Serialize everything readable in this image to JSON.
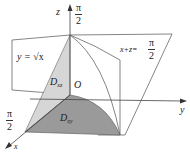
{
  "diagram": {
    "axes": {
      "x": "x",
      "y": "y",
      "z": "z"
    },
    "origin_label": "O",
    "z_intercept": {
      "num": "π",
      "den": "2"
    },
    "x_intercept": {
      "num": "π",
      "den": "2"
    },
    "surface_left": {
      "label": "y = ",
      "radical": "√x"
    },
    "surface_right": {
      "label": "x+z=",
      "num": "π",
      "den": "2"
    },
    "region_xz": {
      "letter": "D",
      "sub": "xz"
    },
    "region_xy": {
      "letter": "D",
      "sub": "xy"
    },
    "colors": {
      "line": "#555555",
      "light_fill": "#d6d6d6",
      "dark_fill": "#9a9a9a"
    }
  }
}
